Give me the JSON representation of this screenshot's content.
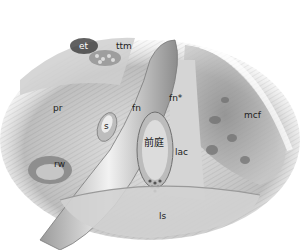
{
  "figure": {
    "type": "anatomical illustration (grayscale pencil drawing)",
    "labels": {
      "et": "et",
      "ttm": "ttm",
      "pr": "pr",
      "fn_left": "fn",
      "fn_star": "fn*",
      "s": "s",
      "vestibule": "前庭",
      "lac": "lac",
      "mcf": "mcf",
      "rw": "rw",
      "ls": "ls"
    }
  },
  "colors": {
    "background": "#ffffff",
    "shade_dark": "#6b6b6b",
    "shade_mid": "#a8a8a8",
    "shade_light": "#d9d9d9",
    "label_text": "#222222"
  }
}
